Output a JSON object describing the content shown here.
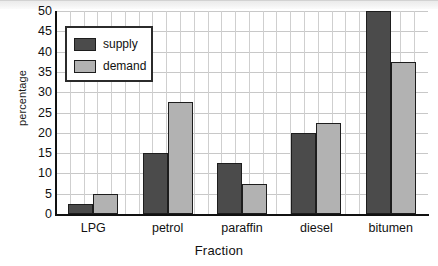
{
  "chart_data": {
    "type": "bar",
    "title": "",
    "xlabel": "Fraction",
    "ylabel": "percentage",
    "categories": [
      "LPG",
      "petrol",
      "paraffin",
      "diesel",
      "bitumen"
    ],
    "series": [
      {
        "name": "supply",
        "color": "#4b4b4b",
        "values": [
          2.5,
          15,
          12.5,
          20,
          50
        ]
      },
      {
        "name": "demand",
        "color": "#b2b2b2",
        "values": [
          5,
          27.5,
          7.5,
          22.5,
          37.5
        ]
      }
    ],
    "ylim": [
      0,
      50
    ],
    "ytick_step": 5,
    "yticks": [
      0,
      5,
      10,
      15,
      20,
      25,
      30,
      35,
      40,
      45,
      50
    ],
    "ytick_labels": [
      "0",
      "5",
      "10",
      "15",
      "20",
      "25",
      "30",
      "35",
      "40",
      "45",
      "50"
    ],
    "grid": true,
    "grid_horizontal": true,
    "grid_vertical": true,
    "legend_position": "top-left",
    "legend_entries": [
      "supply",
      "demand"
    ]
  }
}
